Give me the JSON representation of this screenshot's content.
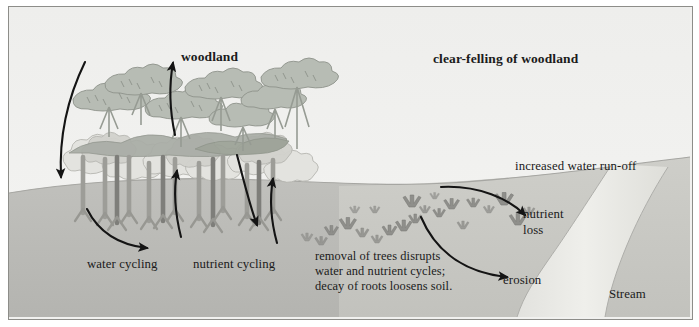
{
  "figure": {
    "type": "scientific-illustration",
    "style": "grayscale textbook diagram with border frame"
  },
  "headings": {
    "left": "woodland",
    "right": "clear-felling of woodland"
  },
  "labels": {
    "water_cycling": "water cycling",
    "nutrient_cycling": "nutrient cycling",
    "increased_runoff": "increased water run-off",
    "nutrient_loss_line1": "nutrient",
    "nutrient_loss_line2": "loss",
    "erosion": "erosion",
    "stream": "Stream",
    "removal_line1": "removal of trees disrupts",
    "removal_line2": "water and nutrient cycles;",
    "removal_line3": "decay of roots loosens soil."
  },
  "colors": {
    "sky": "#f1f1ef",
    "ground_left": "#bdbdb9",
    "ground_right": "#c9c9c5",
    "stream_water": "#e8e8e4",
    "stream_bank": "#b4b4b0",
    "canopy_upper": "#b9bdb6",
    "canopy_lower": "#dcdcd8",
    "trunk": "#9a9a95",
    "trunk_dark": "#7d7d79",
    "stump": "#8e8e8a",
    "arrow": "#151515",
    "frame_border": "#8d8d89",
    "text": "#1b1b1b"
  },
  "arrows": [
    {
      "name": "rain-inflow-arrow",
      "direction": "down",
      "region": "woodland-left"
    },
    {
      "name": "soil-water-arrow",
      "direction": "right-down",
      "region": "woodland-left"
    },
    {
      "name": "transpiration-arrow",
      "direction": "up",
      "region": "woodland-centre"
    },
    {
      "name": "nutrient-uptake-arrow",
      "direction": "up",
      "region": "woodland-centre"
    },
    {
      "name": "litter-fall-arrow",
      "direction": "down",
      "region": "woodland-right"
    },
    {
      "name": "nutrient-return-arrow",
      "direction": "up",
      "region": "woodland-right"
    },
    {
      "name": "nutrient-loss-arrow",
      "direction": "right-down",
      "region": "clear-felled"
    },
    {
      "name": "erosion-arrow",
      "direction": "right-down",
      "region": "clear-felled"
    }
  ],
  "scene_elements": {
    "tree_count_upper_canopy": 8,
    "tree_count_lower_canopy": 9,
    "stump_count": 22,
    "ground_line_description": "gentle hill crest rising to the right then falling toward the stream",
    "stream_description": "pale S-shaped water channel running from top-right to bottom-centre"
  }
}
